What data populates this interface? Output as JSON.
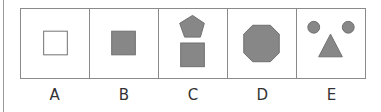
{
  "colors": {
    "fill": "#878787",
    "stroke": "#6f6f6f",
    "border": "#8a8a8a",
    "text": "#333333"
  },
  "options": [
    {
      "label": "A",
      "shapes": [
        "hollow-square"
      ]
    },
    {
      "label": "B",
      "shapes": [
        "filled-square"
      ]
    },
    {
      "label": "C",
      "shapes": [
        "filled-pentagon",
        "filled-square"
      ]
    },
    {
      "label": "D",
      "shapes": [
        "filled-octagon"
      ]
    },
    {
      "label": "E",
      "shapes": [
        "filled-circle",
        "filled-circle",
        "filled-triangle"
      ]
    }
  ]
}
